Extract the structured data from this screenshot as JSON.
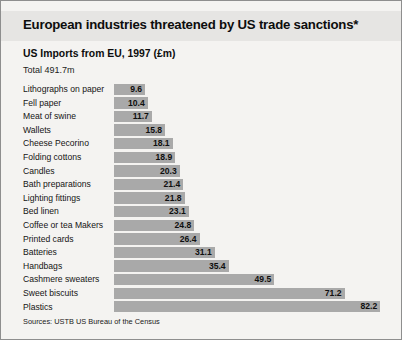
{
  "title": "European industries threatened by US trade sanctions*",
  "subtitle": "US Imports from EU, 1997 (£m)",
  "total": "Total 491.7m",
  "source": "Sources: USTB US Bureau of the Census",
  "colors": {
    "bar": "#a9a9a9",
    "background": "#f4f3f1",
    "title_band": "#e6e5e3",
    "border": "#8e8e8e",
    "text": "#0f0f0f"
  },
  "chart_data": {
    "type": "bar",
    "orientation": "horizontal",
    "title": "European industries threatened by US trade sanctions*",
    "subtitle": "US Imports from EU, 1997 (£m)",
    "xlabel": "",
    "ylabel": "",
    "xlim": [
      0,
      88
    ],
    "grid": false,
    "legend": false,
    "value_labels": true,
    "categories": [
      "Lithographs on paper",
      "Fell paper",
      "Meat of swine",
      "Wallets",
      "Cheese Pecorino",
      "Folding cottons",
      "Candles",
      "Bath preparations",
      "Lighting fittings",
      "Bed linen",
      "Coffee or tea Makers",
      "Printed cards",
      "Batteries",
      "Handbags",
      "Cashmere sweaters",
      "Sweet biscuits",
      "Plastics"
    ],
    "values": [
      9.6,
      10.4,
      11.7,
      15.8,
      18.1,
      18.9,
      20.3,
      21.4,
      21.8,
      23.1,
      24.8,
      26.4,
      31.1,
      35.4,
      49.5,
      71.2,
      82.2
    ],
    "value_text": [
      "9.6",
      "10.4",
      "11.7",
      "15.8",
      "18.1",
      "18.9",
      "20.3",
      "21.4",
      "21.8",
      "23.1",
      "24.8",
      "26.4",
      "31.1",
      "35.4",
      "49.5",
      "71.2",
      "82.2"
    ],
    "total": "Total 491.7m",
    "source": "Sources: USTB US Bureau of the Census"
  }
}
